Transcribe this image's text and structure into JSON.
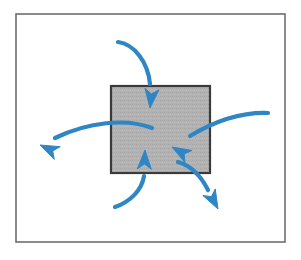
{
  "figure": {
    "type": "diagram",
    "title": "System boundary with inward and outward flow arrows",
    "canvas": {
      "width": 301,
      "height": 260,
      "background": "#ffffff"
    },
    "frame": {
      "name": "outer-frame",
      "x": 16,
      "y": 14,
      "width": 269,
      "height": 228,
      "stroke": "#6e6e6e",
      "stroke_width": 1.6,
      "fill": "#ffffff"
    },
    "box": {
      "name": "system-box",
      "label": "",
      "x": 111,
      "y": 86,
      "width": 99,
      "height": 87,
      "fill": "#b0b0b0",
      "stroke": "#3a3a3a",
      "stroke_width": 2.2,
      "texture": "fine-stipple"
    },
    "arrow_style": {
      "color": "#2f86c5",
      "stroke_width": 4.2,
      "head_length": 19,
      "head_half_width": 7,
      "head_notch": 5
    },
    "arrows": [
      {
        "name": "arrow-inflow-top",
        "direction": "down",
        "enters_box": true,
        "description": "curves from upper-left down into the top of the box",
        "path": "M 118 42 C 134 44, 148 62, 150 84",
        "tip": {
          "x": 150,
          "y": 108
        },
        "angle_deg": 96
      },
      {
        "name": "arrow-outflow-left",
        "direction": "left",
        "enters_box": false,
        "description": "starts inside the box and sweeps out to the left",
        "path": "M 152 128 C 126 118, 88 122, 55 138",
        "tip": {
          "x": 40,
          "y": 145
        },
        "angle_deg": 205
      },
      {
        "name": "arrow-inflow-right",
        "direction": "left",
        "enters_box": true,
        "description": "arrives from the right edge curving into the box",
        "path": "M 268 113 C 238 112, 210 124, 190 136",
        "tip": {
          "x": 172,
          "y": 147
        },
        "angle_deg": 210
      },
      {
        "name": "arrow-inflow-bottom",
        "direction": "up",
        "enters_box": true,
        "description": "curves from lower-left up into the bottom of the box",
        "path": "M 115 207 C 130 202, 142 190, 144 176",
        "tip": {
          "x": 145,
          "y": 150
        },
        "angle_deg": 272
      },
      {
        "name": "arrow-outflow-bottom-right",
        "direction": "down-right",
        "enters_box": false,
        "description": "leaves the box toward the lower right",
        "path": "M 178 162 C 192 166, 202 178, 208 190",
        "tip": {
          "x": 218,
          "y": 209
        },
        "angle_deg": 62
      }
    ]
  }
}
